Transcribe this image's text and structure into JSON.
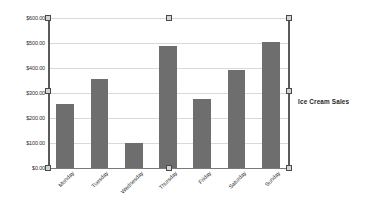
{
  "chart_object": {
    "selected": true,
    "handle_color": "#d4d4d4",
    "handle_border_color": "#4a4a4a"
  },
  "legend": {
    "position": "right",
    "entries": [
      {
        "label": "Ice Cream Sales",
        "color": "#6e6e6e"
      }
    ]
  },
  "axes": {
    "y_tick_labels": [
      "$600.00",
      "$500.00",
      "$400.00",
      "$300.00",
      "$200.00",
      "$100.00",
      "$0.00"
    ],
    "x_tick_labels": [
      "Monday",
      "Tuesday",
      "Wednesday",
      "Thursday",
      "Friday",
      "Saturday",
      "Sunday"
    ]
  },
  "chart_data": {
    "type": "bar",
    "title": "",
    "xlabel": "",
    "ylabel": "",
    "categories": [
      "Monday",
      "Tuesday",
      "Wednesday",
      "Thursday",
      "Friday",
      "Saturday",
      "Sunday"
    ],
    "values": [
      256,
      355,
      100,
      490,
      275,
      392,
      505
    ],
    "series": [
      {
        "name": "Ice Cream Sales",
        "color": "#6e6e6e",
        "values": [
          256,
          355,
          100,
          490,
          275,
          392,
          505
        ]
      }
    ],
    "ylim": [
      0,
      600
    ],
    "ytick_step": 100,
    "ytick_values": [
      0,
      100,
      200,
      300,
      400,
      500,
      600
    ],
    "y_tick_format": "$0.00",
    "grid": "horizontal",
    "legend_position": "right",
    "bar_color": "#6e6e6e",
    "gridline_color": "#d9d9d9",
    "axis_color": "#5a5a5a",
    "annotations": []
  }
}
